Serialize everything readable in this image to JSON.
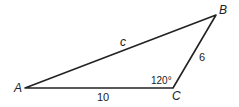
{
  "diagram": {
    "type": "triangle",
    "vertices": {
      "A": {
        "label": "A",
        "x": 25,
        "y": 88
      },
      "B": {
        "label": "B",
        "x": 216,
        "y": 15
      },
      "C": {
        "label": "C",
        "x": 173,
        "y": 88
      }
    },
    "sides": {
      "AB": {
        "label": "c"
      },
      "AC": {
        "label": "10"
      },
      "BC": {
        "label": "6"
      }
    },
    "angles": {
      "C": {
        "label": "120°"
      }
    },
    "stroke_color": "#222222"
  }
}
